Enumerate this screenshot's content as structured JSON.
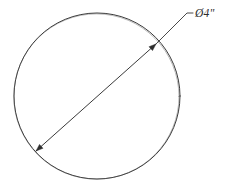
{
  "drawing": {
    "title": "Circle with diameter dimension",
    "background_color": "#ffffff",
    "line_color": "#3a3a3a",
    "text_color": "#2b2b2b",
    "canvas": {
      "width": 225,
      "height": 189
    }
  },
  "shapes": {
    "circle": {
      "name": "circle-outline",
      "center_x": 97,
      "center_y": 96,
      "radius": 83,
      "stroke_width": 1
    },
    "diameter_line": {
      "name": "diameter-line",
      "x1": 36,
      "y1": 151,
      "x2": 156,
      "y2": 44,
      "stroke_width": 1
    },
    "endpoint_start": {
      "name": "diameter-endpoint-lower-left",
      "x": 36,
      "y": 151
    },
    "endpoint_end": {
      "name": "diameter-endpoint-upper-right",
      "x": 156,
      "y": 44
    }
  },
  "leader": {
    "name": "dimension-leader-line",
    "from_x": 156,
    "from_y": 44,
    "elbow_x": 187,
    "elbow_y": 13,
    "to_x": 193,
    "to_y": 13
  },
  "dimension_label": {
    "text": "Ø4\"",
    "symbol": "Ø",
    "value": "4",
    "unit": "\"",
    "unit_name": "inches",
    "x": 195,
    "y": 17,
    "font_size": "11.5px"
  },
  "chart_data": {
    "type": "diagram",
    "annotations": [
      {
        "label": "Ø4\"",
        "meaning": "diameter equals 4 inches",
        "points_to": "circle diameter line"
      }
    ],
    "measurements": [
      {
        "name": "diameter",
        "value": 4,
        "unit": "in",
        "display": "Ø4\""
      }
    ]
  }
}
